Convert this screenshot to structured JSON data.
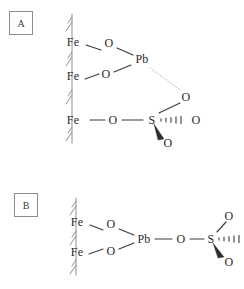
{
  "figure": {
    "type": "chemical-structure-diagram",
    "background_color": "#ffffff",
    "line_color": "#3b3b3b",
    "text_color": "#2a2a2a",
    "surface_color": "#8f8f8f",
    "dotted_bond_color": "#b9b9b9"
  },
  "panels": [
    {
      "id": "A",
      "label": "A",
      "atoms": [
        {
          "name": "fe-top",
          "label": "Fe",
          "x": 73,
          "y": 42
        },
        {
          "name": "fe-middle",
          "label": "Fe",
          "x": 73,
          "y": 76
        },
        {
          "name": "fe-bottom",
          "label": "Fe",
          "x": 73,
          "y": 120
        },
        {
          "name": "o-top",
          "label": "O",
          "x": 109,
          "y": 43
        },
        {
          "name": "o-middle",
          "label": "O",
          "x": 106,
          "y": 74
        },
        {
          "name": "o-chain",
          "label": "O",
          "x": 113,
          "y": 120
        },
        {
          "name": "pb",
          "label": "Pb",
          "x": 142,
          "y": 59
        },
        {
          "name": "s",
          "label": "S",
          "x": 152,
          "y": 120
        },
        {
          "name": "o-sulfate-up",
          "label": "O",
          "x": 186,
          "y": 97
        },
        {
          "name": "o-sulfate-right",
          "label": "O",
          "x": 196,
          "y": 120
        },
        {
          "name": "o-sulfate-down",
          "label": "O",
          "x": 168,
          "y": 143
        }
      ],
      "bonds": [
        {
          "name": "bond-fe-top-o-top",
          "from": "fe-top",
          "to": "o-top",
          "style": "plain"
        },
        {
          "name": "bond-o-top-pb",
          "from": "o-top",
          "to": "pb",
          "style": "plain"
        },
        {
          "name": "bond-fe-middle-o-middle",
          "from": "fe-middle",
          "to": "o-middle",
          "style": "plain"
        },
        {
          "name": "bond-o-middle-pb",
          "from": "o-middle",
          "to": "pb",
          "style": "plain"
        },
        {
          "name": "bond-pb-o-sulfate-up",
          "from": "pb",
          "to": "o-sulfate-up",
          "style": "dotted"
        },
        {
          "name": "bond-fe-bottom-o-chain",
          "from": "fe-bottom",
          "to": "o-chain",
          "style": "plain"
        },
        {
          "name": "bond-o-chain-s",
          "from": "o-chain",
          "to": "s",
          "style": "plain"
        },
        {
          "name": "bond-s-o-up",
          "from": "s",
          "to": "o-sulfate-up",
          "style": "plain"
        },
        {
          "name": "bond-s-o-right",
          "from": "s",
          "to": "o-sulfate-right",
          "style": "hashed-wedge"
        },
        {
          "name": "bond-s-o-down",
          "from": "s",
          "to": "o-sulfate-down",
          "style": "solid-wedge"
        }
      ],
      "surface": {
        "name": "mineral-surface-a",
        "x": 72,
        "top": 14,
        "bottom": 143,
        "hatch_count": 4
      }
    },
    {
      "id": "B",
      "label": "B",
      "atoms": [
        {
          "name": "fe-top",
          "label": "Fe",
          "x": 77,
          "y": 222
        },
        {
          "name": "fe-bottom",
          "label": "Fe",
          "x": 77,
          "y": 252
        },
        {
          "name": "o-top",
          "label": "O",
          "x": 111,
          "y": 224
        },
        {
          "name": "o-bottom",
          "label": "O",
          "x": 111,
          "y": 251
        },
        {
          "name": "pb",
          "label": "Pb",
          "x": 144,
          "y": 239
        },
        {
          "name": "o-chain",
          "label": "O",
          "x": 181,
          "y": 239
        },
        {
          "name": "s",
          "label": "S",
          "x": 211,
          "y": 239
        },
        {
          "name": "o-sulfate-up",
          "label": "O",
          "x": 229,
          "y": 216
        },
        {
          "name": "o-sulfate-down",
          "label": "O",
          "x": 229,
          "y": 262
        }
      ],
      "bonds": [
        {
          "name": "bond-fe-top-o-top",
          "from": "fe-top",
          "to": "o-top",
          "style": "plain"
        },
        {
          "name": "bond-o-top-pb",
          "from": "o-top",
          "to": "pb",
          "style": "plain"
        },
        {
          "name": "bond-fe-bottom-o-bottom",
          "from": "fe-bottom",
          "to": "o-bottom",
          "style": "plain"
        },
        {
          "name": "bond-o-bottom-pb",
          "from": "o-bottom",
          "to": "pb",
          "style": "plain"
        },
        {
          "name": "bond-pb-o-chain",
          "from": "pb",
          "to": "o-chain",
          "style": "plain"
        },
        {
          "name": "bond-o-chain-s",
          "from": "o-chain",
          "to": "s",
          "style": "plain"
        },
        {
          "name": "bond-s-o-up",
          "from": "s",
          "to": "o-sulfate-up",
          "style": "plain"
        },
        {
          "name": "bond-s-o-right",
          "from": "s",
          "to": "edge",
          "style": "hashed-wedge"
        },
        {
          "name": "bond-s-o-down",
          "from": "s",
          "to": "o-sulfate-down",
          "style": "solid-wedge"
        }
      ],
      "surface": {
        "name": "mineral-surface-b",
        "x": 76,
        "top": 198,
        "bottom": 275,
        "hatch_count": 3
      }
    }
  ]
}
